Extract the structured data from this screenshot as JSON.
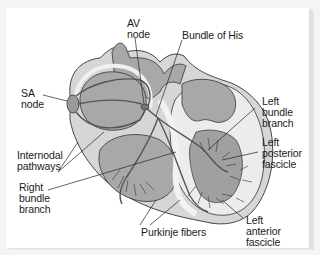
{
  "figure": {
    "colors": {
      "background": "#f4f4f4",
      "panel": "#ffffff",
      "outer_wall": "#d6d6d6",
      "chamber": "#a8a8a8",
      "wall_light": "#e9e9e9",
      "pathway": "#555555",
      "outline": "#333333",
      "leader": "#222222"
    },
    "labels": {
      "av_node": "AV\nnode",
      "bundle_of_his": "Bundle of His",
      "sa_node": "SA\nnode",
      "left_bundle_branch": "Left\nbundle\nbranch",
      "left_posterior_fascicle": "Left\nposterior\nfascicle",
      "internodal_pathways": "Internodal\npathways",
      "right_bundle_branch": "Right\nbundle\nbranch",
      "purkinje_fibers": "Purkinje fibers",
      "left_anterior_fascicle": "Left\nanterior\nfascicle"
    }
  }
}
